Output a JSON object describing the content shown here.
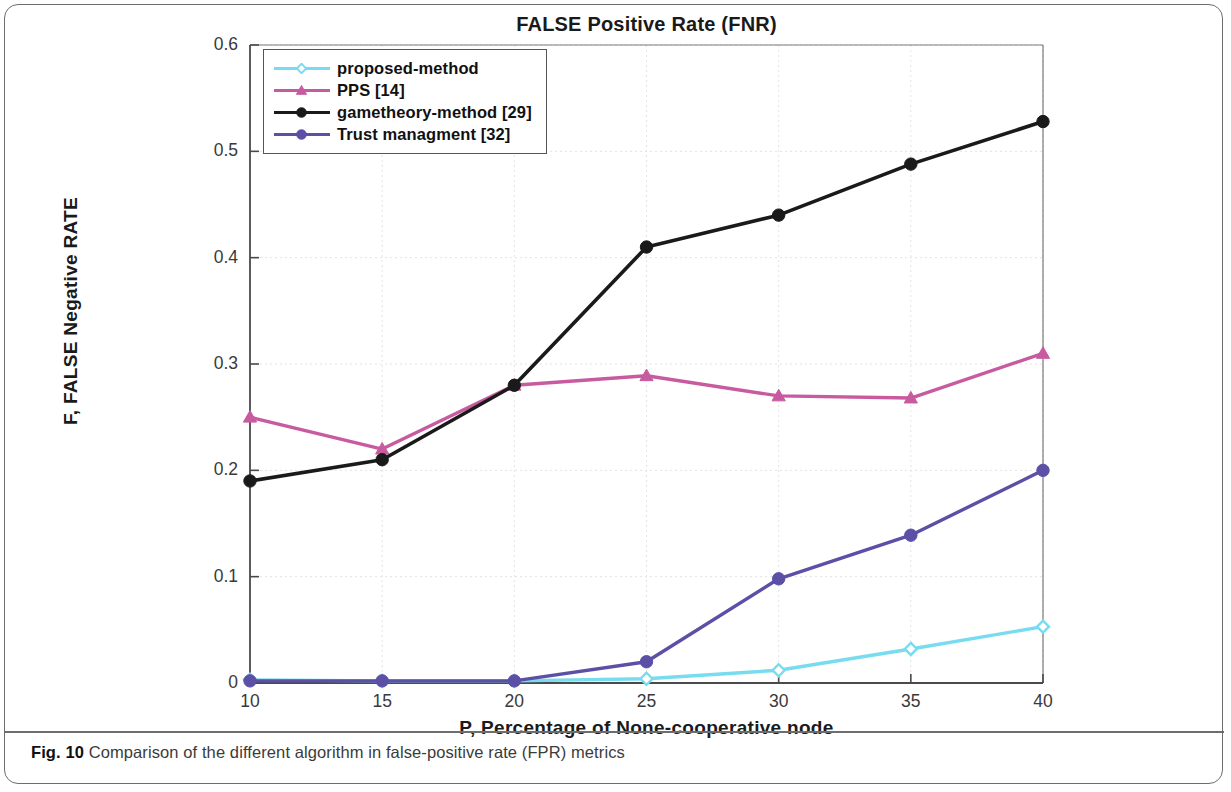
{
  "figure": {
    "caption_prefix": "Fig. 10",
    "caption_text": "Comparison of the different algorithm in false-positive rate (FPR) metrics"
  },
  "chart_data": {
    "type": "line",
    "title": "FALSE Positive Rate (FNR)",
    "xlabel": "P, Percentage of None-cooperative node",
    "ylabel": "F, FALSE Negative RATE",
    "x": [
      10,
      15,
      20,
      25,
      30,
      35,
      40
    ],
    "xlim": [
      10,
      40
    ],
    "ylim": [
      0,
      0.6
    ],
    "xticks": [
      "10",
      "15",
      "20",
      "25",
      "30",
      "35",
      "40"
    ],
    "yticks": [
      "0",
      "0.1",
      "0.2",
      "0.3",
      "0.4",
      "0.5",
      "0.6"
    ],
    "grid": true,
    "legend_position": "top-left",
    "series": [
      {
        "name": "proposed-method",
        "color": "#77DCEF",
        "marker": "diamond",
        "values": [
          0.003,
          0.002,
          0.002,
          0.004,
          0.012,
          0.032,
          0.053
        ]
      },
      {
        "name": "PPS [14]",
        "color": "#C85BA0",
        "marker": "triangle",
        "values": [
          0.25,
          0.22,
          0.28,
          0.289,
          0.27,
          0.268,
          0.31
        ]
      },
      {
        "name": "gametheory-method [29]",
        "color": "#1A1A1A",
        "marker": "circle",
        "values": [
          0.19,
          0.21,
          0.28,
          0.41,
          0.44,
          0.488,
          0.528
        ]
      },
      {
        "name": "Trust managment [32]",
        "color": "#5B4FA6",
        "marker": "circle",
        "values": [
          0.002,
          0.002,
          0.002,
          0.02,
          0.098,
          0.139,
          0.2
        ]
      }
    ]
  }
}
